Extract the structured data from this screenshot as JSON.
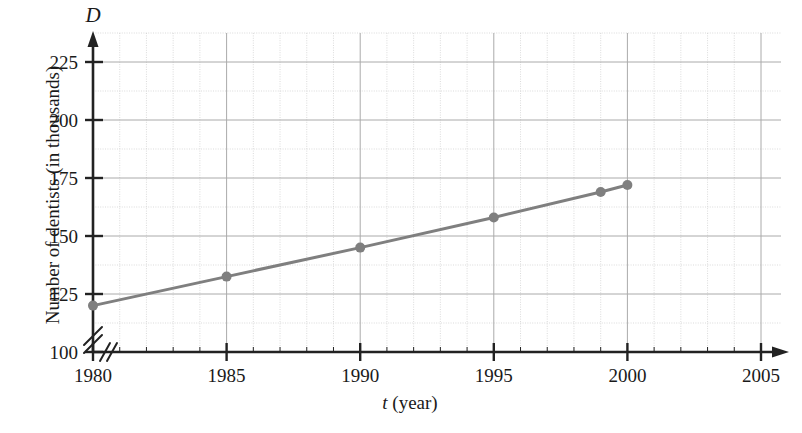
{
  "chart_data": {
    "type": "line",
    "title": "",
    "xlabel": "t (year)",
    "ylabel": "Number of dentists (in thousands)",
    "y_axis_symbol": "D",
    "x_axis_symbol": "t",
    "x": [
      1980,
      1985,
      1990,
      1995,
      1999,
      2000
    ],
    "values": [
      120,
      132.5,
      145,
      158,
      169,
      172
    ],
    "series": [
      {
        "name": "Number of dentists",
        "x": [
          1980,
          1985,
          1990,
          1995,
          1999,
          2000
        ],
        "values": [
          120,
          132.5,
          145,
          158,
          169,
          172
        ]
      }
    ],
    "xlim": [
      1980,
      2005
    ],
    "ylim": [
      100,
      237.5
    ],
    "xticks": [
      1980,
      1985,
      1990,
      1995,
      2000,
      2005
    ],
    "xtick_labels": [
      "1980",
      "1985",
      "1990",
      "1995",
      "2000",
      "2005"
    ],
    "yticks": [
      100,
      125,
      150,
      175,
      200,
      225
    ],
    "ytick_labels": [
      "100",
      "125",
      "150",
      "175",
      "200",
      "225"
    ],
    "x_minor_step": 1,
    "y_major_step": 25,
    "y_minor_step": 12.5,
    "grid": true,
    "legend": "none",
    "axis_break_x": true,
    "axis_break_y": true,
    "colors": {
      "line": "#7f7f7f",
      "marker": "#7f7f7f",
      "grid_major": "#aaaaaa",
      "grid_minor": "#cccccc",
      "axis": "#222222",
      "text": "#1a1a1a"
    }
  },
  "axis_labels": {
    "y_symbol": "D",
    "x_title_symbol": "t",
    "x_title_unit": "(year)",
    "y_title": "Number of dentists (in thousands)"
  }
}
